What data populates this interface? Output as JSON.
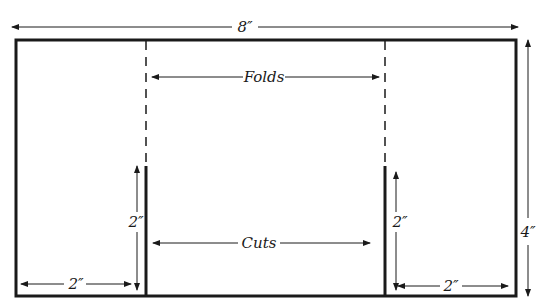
{
  "diagram": {
    "type": "pocket-folder-template",
    "colors": {
      "line": "#1a1a1a",
      "background": "#ffffff"
    },
    "labels": {
      "overall_width": "8″",
      "overall_height": "4″",
      "folds": "Folds",
      "cuts": "Cuts",
      "left_cut_height": "2″",
      "right_cut_height": "2″",
      "left_pocket_width": "2″",
      "right_pocket_width": "2″"
    }
  }
}
